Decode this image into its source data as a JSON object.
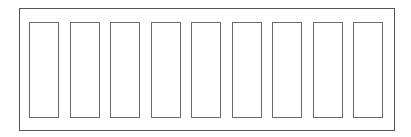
{
  "diagram": {
    "frame": {
      "label": ""
    },
    "slot_count": 9,
    "slots": [
      {
        "label": ""
      },
      {
        "label": ""
      },
      {
        "label": ""
      },
      {
        "label": ""
      },
      {
        "label": ""
      },
      {
        "label": ""
      },
      {
        "label": ""
      },
      {
        "label": ""
      },
      {
        "label": ""
      }
    ],
    "colors": {
      "frame_stroke": "#555555",
      "slot_stroke": "#6a6a6a",
      "fill": "#ffffff"
    }
  }
}
